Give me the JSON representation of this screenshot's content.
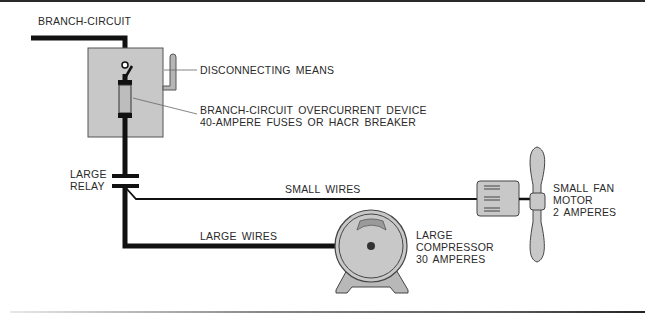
{
  "diagram": {
    "labels": {
      "branch_circuit": "BRANCH-CIRCUIT",
      "disconnecting_means": "DISCONNECTING MEANS",
      "overcurrent_line1": "BRANCH-CIRCUIT OVERCURRENT DEVICE",
      "overcurrent_line2": "40-AMPERE FUSES OR HACR BREAKER",
      "relay_line1": "LARGE",
      "relay_line2": "RELAY",
      "small_wires": "SMALL WIRES",
      "large_wires": "LARGE WIRES",
      "compressor_line1": "LARGE",
      "compressor_line2": "COMPRESSOR",
      "compressor_line3": "30 AMPERES",
      "fan_line1": "SMALL FAN",
      "fan_line2": "MOTOR",
      "fan_line3": "2 AMPERES"
    },
    "colors": {
      "wire": "#111111",
      "enclosure_fill": "#c8c8c8",
      "component_fill": "#bdbdbd",
      "text": "#2a2a2a",
      "leader": "#555555"
    }
  }
}
